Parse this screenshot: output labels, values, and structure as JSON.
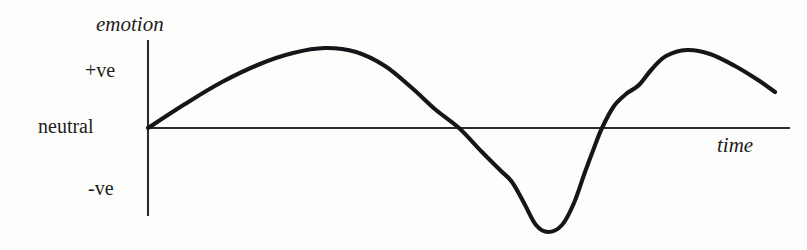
{
  "figure": {
    "background_color": "#fdfdfc",
    "ink_color": "#16161a",
    "axis_color": "#2b2b2b",
    "width": 807,
    "height": 250
  },
  "labels": {
    "y_axis_title": "emotion",
    "x_axis_title": "time",
    "y_tick_positive": "+ve",
    "y_tick_neutral": "neutral",
    "y_tick_negative": "-ve"
  },
  "chart_data": {
    "type": "line",
    "title": "",
    "xlabel": "time",
    "ylabel": "emotion",
    "grid": false,
    "legend": null,
    "x_axis": {
      "label": "time",
      "ticks": [],
      "range_px": [
        148,
        790
      ],
      "baseline_y_px": 128
    },
    "y_axis": {
      "label": "emotion",
      "tick_labels": [
        "+ve",
        "neutral",
        "-ve"
      ],
      "tick_values": [
        1,
        0,
        -1
      ],
      "tick_y_px": [
        72,
        128,
        190
      ],
      "range_px": [
        40,
        216
      ],
      "axis_x_px": 148
    },
    "series": [
      {
        "name": "emotion",
        "smooth": true,
        "points_px": [
          [
            148,
            128
          ],
          [
            185,
            104
          ],
          [
            222,
            82
          ],
          [
            260,
            64
          ],
          [
            293,
            53
          ],
          [
            325,
            48
          ],
          [
            356,
            52
          ],
          [
            385,
            66
          ],
          [
            412,
            88
          ],
          [
            436,
            110
          ],
          [
            459,
            128
          ],
          [
            482,
            152
          ],
          [
            500,
            170
          ],
          [
            512,
            182
          ],
          [
            524,
            203
          ],
          [
            536,
            225
          ],
          [
            548,
            232
          ],
          [
            562,
            225
          ],
          [
            574,
            203
          ],
          [
            585,
            172
          ],
          [
            594,
            148
          ],
          [
            602,
            128
          ],
          [
            614,
            106
          ],
          [
            626,
            94
          ],
          [
            632,
            90
          ],
          [
            640,
            84
          ],
          [
            652,
            69
          ],
          [
            666,
            56
          ],
          [
            687,
            50
          ],
          [
            710,
            54
          ],
          [
            735,
            66
          ],
          [
            758,
            80
          ],
          [
            775,
            92
          ]
        ],
        "annotations": [
          {
            "name": "first-peak",
            "x_px": 325,
            "y_px": 48,
            "value": "+ve maximum"
          },
          {
            "name": "first-zero-crossing",
            "x_px": 459,
            "y_px": 128,
            "value": "neutral"
          },
          {
            "name": "shoulder",
            "x_px": 512,
            "y_px": 182,
            "value": "slope change"
          },
          {
            "name": "trough",
            "x_px": 548,
            "y_px": 232,
            "value": "-ve minimum"
          },
          {
            "name": "second-zero-crossing",
            "x_px": 602,
            "y_px": 128,
            "value": "neutral"
          },
          {
            "name": "kink",
            "x_px": 632,
            "y_px": 90,
            "value": "small hitch"
          },
          {
            "name": "second-peak",
            "x_px": 687,
            "y_px": 50,
            "value": "+ve maximum"
          }
        ]
      }
    ]
  }
}
